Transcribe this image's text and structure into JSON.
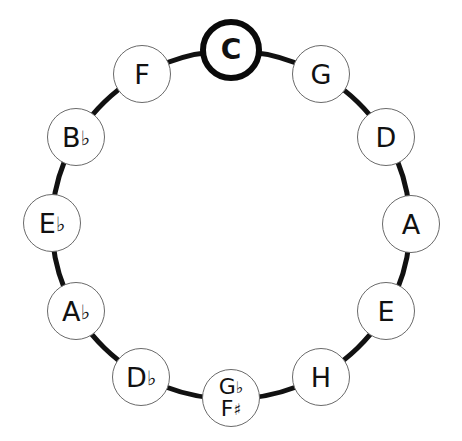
{
  "diagram": {
    "type": "circle-of-fifths",
    "ring": {
      "cx": 231,
      "cy": 225,
      "rx": 179,
      "ry": 174,
      "stroke": "#111111",
      "stroke_width": 5
    },
    "highlight_color": "#0a0a0a",
    "nodes": [
      {
        "id": "C",
        "lines": [
          {
            "note": "C",
            "acc": ""
          }
        ],
        "x": 231,
        "y": 50,
        "tonic": true
      },
      {
        "id": "G",
        "lines": [
          {
            "note": "G",
            "acc": ""
          }
        ],
        "x": 321,
        "y": 74
      },
      {
        "id": "D",
        "lines": [
          {
            "note": "D",
            "acc": ""
          }
        ],
        "x": 386,
        "y": 137
      },
      {
        "id": "A",
        "lines": [
          {
            "note": "A",
            "acc": ""
          }
        ],
        "x": 411,
        "y": 224
      },
      {
        "id": "E",
        "lines": [
          {
            "note": "E",
            "acc": ""
          }
        ],
        "x": 386,
        "y": 311
      },
      {
        "id": "H",
        "lines": [
          {
            "note": "H",
            "acc": ""
          }
        ],
        "x": 321,
        "y": 377
      },
      {
        "id": "Gb-F#",
        "lines": [
          {
            "note": "G",
            "acc": "♭"
          },
          {
            "note": "F",
            "acc": "♯"
          }
        ],
        "x": 231,
        "y": 398
      },
      {
        "id": "Db",
        "lines": [
          {
            "note": "D",
            "acc": "♭"
          }
        ],
        "x": 141,
        "y": 377
      },
      {
        "id": "Ab",
        "lines": [
          {
            "note": "A",
            "acc": "♭"
          }
        ],
        "x": 76,
        "y": 311
      },
      {
        "id": "Eb",
        "lines": [
          {
            "note": "E",
            "acc": "♭"
          }
        ],
        "x": 52,
        "y": 223
      },
      {
        "id": "Bb",
        "lines": [
          {
            "note": "B",
            "acc": "♭"
          }
        ],
        "x": 76,
        "y": 137
      },
      {
        "id": "F",
        "lines": [
          {
            "note": "F",
            "acc": ""
          }
        ],
        "x": 142,
        "y": 74
      }
    ]
  }
}
